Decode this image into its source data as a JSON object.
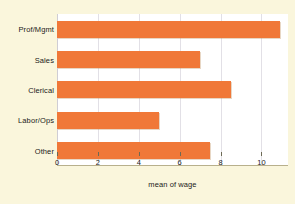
{
  "chart_data": {
    "type": "bar",
    "orientation": "horizontal",
    "title": "",
    "xlabel": "mean of wage",
    "ylabel": "",
    "categories": [
      "Prof/Mgmt",
      "Sales",
      "Clerical",
      "Labor/Ops",
      "Other"
    ],
    "values": [
      10.9,
      7.0,
      8.5,
      5.0,
      7.5
    ],
    "xlim": [
      0,
      11.3
    ],
    "xticks": [
      0,
      2,
      4,
      6,
      8,
      10
    ],
    "xticklabels": [
      "0",
      "2",
      "4",
      "6",
      "8",
      "10"
    ],
    "grid": true,
    "legend": null,
    "colors": {
      "bar": "#f07838",
      "background": "#faf6dc",
      "plot_background": "#ffffff",
      "gridline": "#e2e0e6",
      "axis": "#6d6a55",
      "text": "#1a1a1a"
    }
  }
}
